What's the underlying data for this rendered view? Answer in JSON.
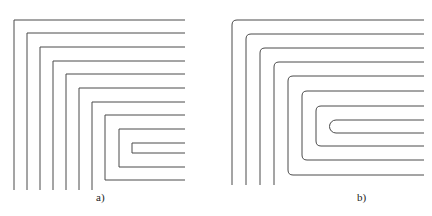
{
  "figure": {
    "panels": [
      {
        "id": "a",
        "label": "a)",
        "corner_style": "sharp",
        "description": "Meander/spiral trace pattern with square corners"
      },
      {
        "id": "b",
        "label": "b)",
        "corner_style": "rounded",
        "description": "Meander/spiral trace pattern with rounded corners"
      }
    ],
    "stroke_color": "#4a4a4a",
    "background": "#ffffff"
  }
}
